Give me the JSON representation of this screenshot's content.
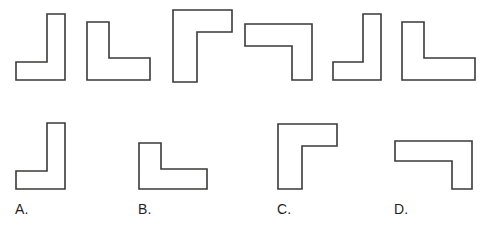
{
  "page": {
    "background_color": "#ffffff",
    "width": 481,
    "height": 228
  },
  "style": {
    "stroke_color": "#3a3a38",
    "fill_color": "#ffffff",
    "stroke_width": 1.6,
    "label_color": "#1f1f1f",
    "artifact_tint": "#5f7a55"
  },
  "top_row": {
    "name": "stimulus-row",
    "count": 6,
    "shapes": [
      {
        "id": "top-shape-1",
        "orientation": "J",
        "description": "Vertical bar on the right with a foot extending to the left at the bottom",
        "x": 14,
        "y": 12,
        "w": 56,
        "h": 70,
        "points": "33,2 51,2 51,68 2,68 2,50 33,50"
      },
      {
        "id": "top-shape-2",
        "orientation": "L",
        "description": "Vertical bar on the left with a foot extending to the right at the bottom",
        "x": 85,
        "y": 20,
        "w": 67,
        "h": 62,
        "points": "2,2 24,2 24,38 65,38 65,60 2,60"
      },
      {
        "id": "top-shape-3",
        "orientation": "Gamma",
        "description": "Vertical bar on the left with an arm extending right at the top",
        "x": 171,
        "y": 8,
        "w": 63,
        "h": 76,
        "points": "2,2 61,2 61,24 26,24 26,74 2,74"
      },
      {
        "id": "top-shape-4",
        "orientation": "seven",
        "description": "Horizontal bar across the top with a leg descending on the right",
        "x": 243,
        "y": 22,
        "w": 71,
        "h": 60,
        "points": "2,2 69,2 69,58 49,58 49,24 2,24"
      },
      {
        "id": "top-shape-5",
        "orientation": "J",
        "description": "Vertical bar on the right with a foot extending to the left at the bottom",
        "x": 331,
        "y": 12,
        "w": 55,
        "h": 70,
        "points": "32,2 50,2 50,68 2,68 2,50 32,50"
      },
      {
        "id": "top-shape-6",
        "orientation": "L",
        "description": "Vertical bar on the left with a foot extending to the right at the bottom",
        "x": 400,
        "y": 20,
        "w": 77,
        "h": 62,
        "points": "2,2 24,2 24,38 75,38 75,60 2,60"
      }
    ]
  },
  "bottom_row": {
    "name": "answer-choices-row",
    "count": 4,
    "choices": [
      {
        "id": "choice-a",
        "label": "A.",
        "orientation": "J",
        "description": "Vertical bar on the right with a foot extending to the left at the bottom",
        "shape_x": 14,
        "shape_y": 121,
        "shape_w": 56,
        "shape_h": 70,
        "points": "33,2 51,2 51,68 2,68 2,50 33,50",
        "label_x": 15,
        "label_y": 202
      },
      {
        "id": "choice-b",
        "label": "B.",
        "orientation": "L",
        "description": "Vertical bar on the left with a foot extending to the right at the bottom",
        "shape_x": 137,
        "shape_y": 141,
        "shape_w": 72,
        "shape_h": 50,
        "points": "2,2 24,2 24,28 70,28 70,48 2,48",
        "label_x": 138,
        "label_y": 202
      },
      {
        "id": "choice-c",
        "label": "C.",
        "orientation": "Gamma",
        "description": "Vertical bar on the left with an arm extending right at the top",
        "shape_x": 276,
        "shape_y": 122,
        "shape_w": 63,
        "shape_h": 69,
        "points": "2,2 61,2 61,24 26,24 26,67 2,67",
        "label_x": 277,
        "label_y": 202
      },
      {
        "id": "choice-d",
        "label": "D.",
        "orientation": "seven",
        "description": "Horizontal bar across the top with a leg descending on the right",
        "shape_x": 393,
        "shape_y": 139,
        "shape_w": 81,
        "shape_h": 52,
        "points": "2,2 79,2 79,50 59,50 59,22 2,22",
        "label_x": 394,
        "label_y": 202
      }
    ]
  }
}
